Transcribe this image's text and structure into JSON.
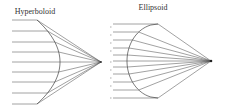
{
  "diagrams": [
    {
      "id": "hyperboloid",
      "title": "Hyperboloid",
      "title_pos": [
        35,
        14
      ],
      "focus": [
        101,
        62
      ],
      "mirror": {
        "top": [
          37,
          20
        ],
        "vertex": [
          60,
          62
        ],
        "bottom": [
          37,
          104
        ]
      },
      "ray_y": [
        20,
        31,
        42,
        52,
        62,
        72,
        82,
        93,
        104
      ],
      "ray_start_x": 12,
      "ticks_x": 110,
      "ticks_y": [
        27,
        35,
        43,
        51,
        62,
        70,
        78,
        86,
        98
      ]
    },
    {
      "id": "ellipsoid",
      "title": "Ellipsoid",
      "title_pos": [
        153,
        10
      ],
      "focus": [
        211,
        61
      ],
      "mirror": {
        "top": [
          158,
          24
        ],
        "vertex": [
          127,
          61
        ],
        "bottom": [
          158,
          98
        ]
      },
      "ray_y": [
        24,
        32,
        40,
        48,
        55,
        61,
        67,
        74,
        82,
        90,
        98
      ],
      "ray_start_x": 113
    }
  ],
  "colors": {
    "line": "#555555",
    "text": "#333333",
    "background": "#ffffff"
  }
}
